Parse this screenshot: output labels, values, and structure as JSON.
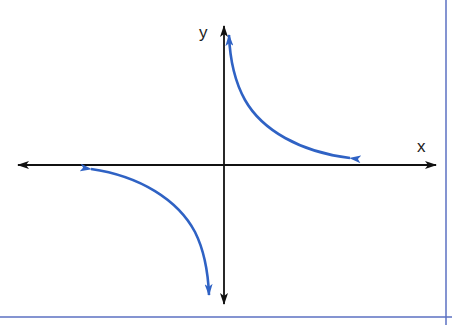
{
  "diagram": {
    "type": "hyperbola-graph",
    "axes": {
      "x_label": "x",
      "y_label": "y"
    },
    "colors": {
      "axis": "#111111",
      "curve": "#2f62c4",
      "frame": "#5b70c2",
      "background": "#ffffff"
    },
    "branches": [
      {
        "name": "quadrant-I-branch",
        "quadrant": "I"
      },
      {
        "name": "quadrant-III-branch",
        "quadrant": "III"
      }
    ]
  }
}
